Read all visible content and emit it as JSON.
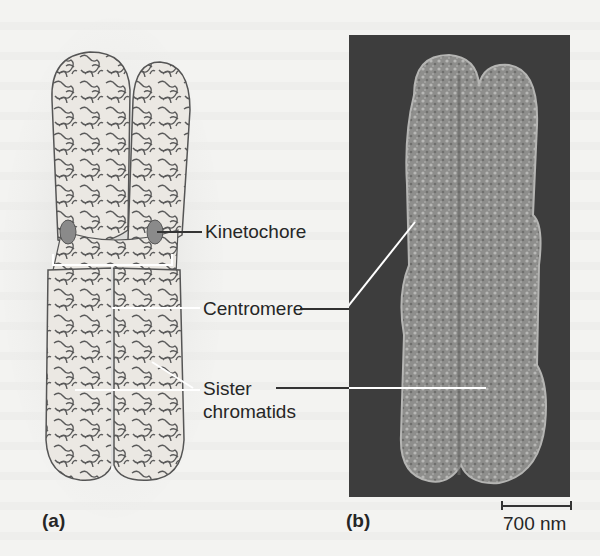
{
  "figure": {
    "panels": [
      {
        "id": "a",
        "label": "(a)",
        "type": "illustration",
        "subject": "duplicated chromosome drawing"
      },
      {
        "id": "b",
        "label": "(b)",
        "type": "micrograph",
        "subject": "SEM of duplicated chromosome"
      }
    ],
    "annotations": {
      "kinetochore": "Kinetochore",
      "centromere": "Centromere",
      "sister_line1": "Sister",
      "sister_line2": "chromatids"
    },
    "scale_bar": {
      "label": "700 nm"
    },
    "colors": {
      "background": "#f3f3f1",
      "micrograph_bg": "#3d3d3d",
      "chromosome_fill": "#e9e6e1",
      "chromosome_line": "#555555",
      "kinetochore": "#8a8a8a",
      "leader_line": "#ffffff"
    }
  }
}
